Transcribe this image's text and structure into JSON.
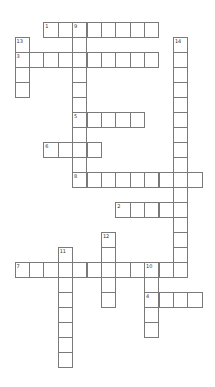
{
  "puzzle": {
    "type": "crossword",
    "grid": {
      "origin_x": 14.5,
      "origin_y": 22.3,
      "cell_w": 14.4,
      "cell_h": 15
    },
    "colors": {
      "line": "#7a7a7a",
      "background": "#ffffff",
      "number": "#333333"
    },
    "entries": [
      {
        "number": "1",
        "direction": "across",
        "row": 0,
        "col": 2,
        "length": 8
      },
      {
        "number": "9",
        "direction": "down",
        "row": 0,
        "col": 4,
        "length": 11
      },
      {
        "number": "13",
        "direction": "down",
        "row": 1,
        "col": 0,
        "length": 4
      },
      {
        "number": "14",
        "direction": "down",
        "row": 1,
        "col": 11,
        "length": 16
      },
      {
        "number": "3",
        "direction": "across",
        "row": 2,
        "col": 0,
        "length": 10
      },
      {
        "number": "5",
        "direction": "across",
        "row": 6,
        "col": 4,
        "length": 5
      },
      {
        "number": "6",
        "direction": "across",
        "row": 8,
        "col": 2,
        "length": 4
      },
      {
        "number": "8",
        "direction": "across",
        "row": 10,
        "col": 4,
        "length": 9
      },
      {
        "number": "2",
        "direction": "across",
        "row": 12,
        "col": 7,
        "length": 5
      },
      {
        "number": "12",
        "direction": "down",
        "row": 14,
        "col": 6,
        "length": 5
      },
      {
        "number": "11",
        "direction": "down",
        "row": 15,
        "col": 3,
        "length": 8
      },
      {
        "number": "7",
        "direction": "across",
        "row": 16,
        "col": 0,
        "length": 12
      },
      {
        "number": "10",
        "direction": "down",
        "row": 16,
        "col": 9,
        "length": 5
      },
      {
        "number": "4",
        "direction": "across",
        "row": 18,
        "col": 9,
        "length": 4
      }
    ]
  }
}
